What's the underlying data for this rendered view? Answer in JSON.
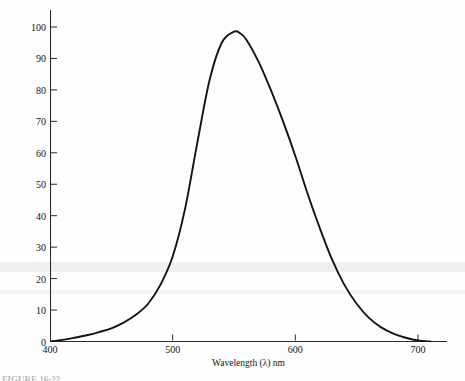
{
  "figure": {
    "caption": "FIGURE 16-22"
  },
  "chart_data": {
    "type": "line",
    "title": "",
    "subtitle": "",
    "xlabel": "Wavelength (λ) nm",
    "ylabel": "Relative sensitivity of the eye",
    "xlim": [
      400,
      710
    ],
    "ylim": [
      0,
      104
    ],
    "grid": false,
    "legend": null,
    "legend_position": "none",
    "line_color": "#131313",
    "axis_color": "#2a2a2a",
    "x_ticks": [
      400,
      500,
      600,
      700
    ],
    "x_tick_labels": [
      "400",
      "500",
      "600",
      "700"
    ],
    "y_ticks": [
      0,
      10,
      20,
      30,
      40,
      50,
      60,
      70,
      80,
      90,
      100
    ],
    "y_tick_labels": [
      "0",
      "10",
      "20",
      "30",
      "40",
      "50",
      "60",
      "70",
      "80",
      "90",
      "100"
    ],
    "series": [
      {
        "name": "Relative sensitivity of the eye",
        "x": [
          400,
          410,
          420,
          430,
          440,
          450,
          460,
          470,
          480,
          490,
          500,
          510,
          520,
          530,
          540,
          550,
          555,
          560,
          570,
          580,
          590,
          600,
          610,
          620,
          630,
          640,
          650,
          660,
          670,
          680,
          690,
          700,
          710
        ],
        "values": [
          0,
          0.5,
          1.2,
          2.0,
          3.0,
          4.2,
          6.0,
          8.5,
          12.0,
          18.0,
          27.0,
          42.0,
          63.0,
          83.0,
          95.0,
          98.5,
          98.0,
          96.0,
          89.0,
          80.0,
          70.0,
          59.0,
          47.0,
          36.0,
          26.0,
          18.0,
          12.0,
          7.5,
          4.5,
          2.5,
          1.2,
          0.3,
          0
        ]
      }
    ],
    "annotations": [
      {
        "label": "peak",
        "x": 550,
        "y": 98.5
      }
    ]
  }
}
